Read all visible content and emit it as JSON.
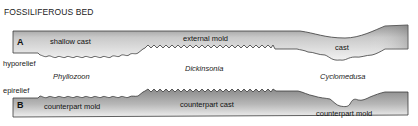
{
  "title": "FOSSILIFEROUS BED",
  "panel_a": {
    "letter": "A",
    "labels": {
      "left": "shallow cast",
      "middle": "external mold",
      "right": "cast"
    },
    "bottom_label": "hyporelief"
  },
  "taxa": {
    "left": "Phyllozoon",
    "middle": "Dickinsonia",
    "right": "Cyclomedusa"
  },
  "panel_b": {
    "letter": "B",
    "top_label": "epirelief",
    "labels": {
      "left": "counterpart mold",
      "middle": "counterpart cast",
      "right": "counterpart mold"
    }
  },
  "colors": {
    "fill_light": "#e6e6e6",
    "fill_dark": "#8f8f8f",
    "stroke": "#333333"
  }
}
